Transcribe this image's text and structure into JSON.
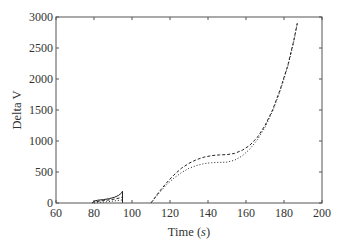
{
  "chart_data": {
    "type": "line",
    "title": "",
    "xlabel": "Time (s)",
    "xlabel_parts": {
      "prefix": "Time (",
      "unit": "s",
      "suffix": ")"
    },
    "ylabel": "Delta V",
    "xlim": [
      60,
      200
    ],
    "ylim": [
      0,
      3000
    ],
    "xticks": [
      60,
      80,
      100,
      120,
      140,
      160,
      180,
      200
    ],
    "yticks": [
      0,
      500,
      1000,
      1500,
      2000,
      2500,
      3000
    ],
    "grid": false,
    "legend": null,
    "series": [
      {
        "name": "solid",
        "style": "solid",
        "segments": [
          [
            [
              79,
              0
            ],
            [
              80,
              30
            ],
            [
              82,
              45
            ],
            [
              85,
              55
            ],
            [
              88,
              70
            ],
            [
              91,
              95
            ],
            [
              93,
              125
            ],
            [
              94.5,
              160
            ],
            [
              95,
              190
            ],
            [
              95,
              0
            ]
          ]
        ]
      },
      {
        "name": "dashed",
        "style": "dashed",
        "segments": [
          [
            [
              79,
              0
            ],
            [
              80,
              20
            ],
            [
              83,
              30
            ],
            [
              87,
              45
            ],
            [
              91,
              65
            ],
            [
              94,
              85
            ],
            [
              95,
              100
            ],
            [
              95,
              0
            ]
          ],
          [
            [
              110,
              0
            ],
            [
              114,
              170
            ],
            [
              118,
              320
            ],
            [
              122,
              450
            ],
            [
              126,
              560
            ],
            [
              130,
              640
            ],
            [
              134,
              700
            ],
            [
              138,
              740
            ],
            [
              142,
              765
            ],
            [
              146,
              775
            ],
            [
              150,
              780
            ],
            [
              154,
              800
            ],
            [
              158,
              850
            ],
            [
              162,
              930
            ],
            [
              166,
              1060
            ],
            [
              170,
              1250
            ],
            [
              174,
              1500
            ],
            [
              178,
              1830
            ],
            [
              182,
              2220
            ],
            [
              185,
              2600
            ],
            [
              187,
              2900
            ]
          ]
        ]
      },
      {
        "name": "dotted",
        "style": "dotted",
        "segments": [
          [
            [
              80,
              0
            ],
            [
              83,
              10
            ],
            [
              87,
              20
            ],
            [
              91,
              35
            ],
            [
              94,
              45
            ],
            [
              95,
              50
            ]
          ],
          [
            [
              110,
              0
            ],
            [
              114,
              150
            ],
            [
              118,
              290
            ],
            [
              122,
              400
            ],
            [
              126,
              490
            ],
            [
              130,
              560
            ],
            [
              134,
              605
            ],
            [
              138,
              635
            ],
            [
              142,
              650
            ],
            [
              146,
              655
            ],
            [
              150,
              660
            ],
            [
              154,
              690
            ],
            [
              158,
              760
            ],
            [
              162,
              870
            ],
            [
              166,
              1020
            ],
            [
              170,
              1220
            ],
            [
              174,
              1480
            ],
            [
              178,
              1810
            ],
            [
              182,
              2200
            ],
            [
              185,
              2580
            ],
            [
              187,
              2900
            ]
          ]
        ]
      }
    ]
  }
}
